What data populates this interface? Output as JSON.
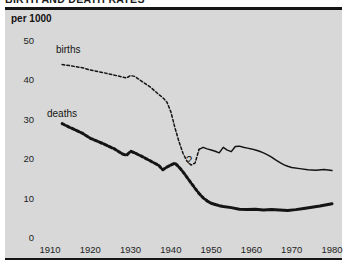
{
  "chart_title": "BIRTH AND DEATH RATES",
  "unit_label": "per 1000",
  "gap_marker": "?",
  "colors": {
    "panel_background": "#d8d8d8",
    "page_background": "#ffffff",
    "ink": "#141414",
    "births_line": "#1a1a1a",
    "deaths_line": "#0d0d0d"
  },
  "axes": {
    "y_ticks": [
      "0",
      "10",
      "20",
      "30",
      "40",
      "50"
    ],
    "x_ticks": [
      "1910",
      "1920",
      "1930",
      "1940",
      "1950",
      "1960",
      "1970",
      "1980"
    ]
  },
  "series_labels": {
    "births": "births",
    "deaths": "deaths"
  },
  "chart_data": {
    "type": "line",
    "title": "BIRTH AND DEATH RATES",
    "subtitle": "per 1000",
    "xlabel": "",
    "ylabel": "per 1000",
    "xlim": [
      1908,
      1981
    ],
    "ylim": [
      0,
      52
    ],
    "x_ticks": [
      1910,
      1920,
      1930,
      1940,
      1950,
      1960,
      1970,
      1980
    ],
    "y_ticks": [
      0,
      10,
      20,
      30,
      40,
      50
    ],
    "grid": false,
    "legend": "inline-annotations",
    "annotations": [
      {
        "text": "births",
        "x": 1917,
        "y": 47
      },
      {
        "text": "deaths",
        "x": 1915,
        "y": 27
      },
      {
        "text": "?",
        "x": 1946,
        "y": 18.5,
        "note": "wartime data gap"
      }
    ],
    "series": [
      {
        "name": "births",
        "style": "dashed-then-solid",
        "x": [
          1913,
          1915,
          1918,
          1920,
          1923,
          1926,
          1929,
          1930,
          1931,
          1933,
          1935,
          1937,
          1938,
          1939,
          1940,
          1941,
          1942,
          1943,
          1944,
          1945,
          1946,
          1947,
          1948,
          1949,
          1950,
          1951,
          1952,
          1953,
          1954,
          1955,
          1956,
          1957,
          1958,
          1959,
          1960,
          1961,
          1962,
          1963,
          1964,
          1965,
          1966,
          1967,
          1968,
          1969,
          1970,
          1972,
          1974,
          1976,
          1978,
          1980
        ],
        "y": [
          44.0,
          43.7,
          43.2,
          42.6,
          42.0,
          41.3,
          40.6,
          41.2,
          41.0,
          39.6,
          38.2,
          36.4,
          35.6,
          34.5,
          32.0,
          28.0,
          24.5,
          21.5,
          19.5,
          18.5,
          19.0,
          22.5,
          23.0,
          22.6,
          22.3,
          22.0,
          21.6,
          23.0,
          22.3,
          21.9,
          23.2,
          23.3,
          23.0,
          22.8,
          22.6,
          22.3,
          22.0,
          21.6,
          21.1,
          20.5,
          19.8,
          19.2,
          18.6,
          18.2,
          17.9,
          17.6,
          17.3,
          17.2,
          17.4,
          17.1
        ]
      },
      {
        "name": "deaths",
        "style": "dashed-then-solid-heavy",
        "x": [
          1913,
          1915,
          1918,
          1920,
          1923,
          1926,
          1928,
          1929,
          1930,
          1931,
          1933,
          1935,
          1937,
          1938,
          1939,
          1940,
          1941,
          1942,
          1943,
          1944,
          1945,
          1946,
          1947,
          1948,
          1949,
          1950,
          1951,
          1952,
          1953,
          1955,
          1957,
          1959,
          1961,
          1963,
          1965,
          1967,
          1969,
          1971,
          1973,
          1975,
          1977,
          1979,
          1980
        ],
        "y": [
          29.0,
          28.0,
          26.6,
          25.3,
          24.0,
          22.6,
          21.3,
          21.0,
          22.0,
          21.6,
          20.6,
          19.5,
          18.4,
          17.3,
          18.0,
          18.5,
          19.0,
          18.0,
          16.8,
          15.4,
          14.0,
          12.6,
          11.3,
          10.2,
          9.4,
          8.8,
          8.5,
          8.2,
          8.0,
          7.7,
          7.3,
          7.2,
          7.3,
          7.1,
          7.2,
          7.1,
          7.0,
          7.2,
          7.5,
          7.8,
          8.1,
          8.5,
          8.7
        ]
      }
    ]
  }
}
